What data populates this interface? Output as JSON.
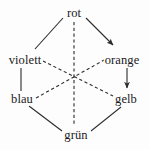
{
  "figure": {
    "type": "color-hexagon-diagram",
    "background_color": "#fdfdfd",
    "stroke_color": "#2b2b2b",
    "text_color": "#1a1a1a"
  },
  "nodes": [
    {
      "id": "rot",
      "label": "rot",
      "position": "top",
      "x": 74,
      "y": 13
    },
    {
      "id": "violett",
      "label": "violett",
      "position": "upper-left",
      "x": 25,
      "y": 60
    },
    {
      "id": "orange",
      "label": "orange",
      "position": "upper-right",
      "x": 122,
      "y": 60
    },
    {
      "id": "blau",
      "label": "blau",
      "position": "lower-left",
      "x": 22,
      "y": 99
    },
    {
      "id": "gelb",
      "label": "gelb",
      "position": "lower-right",
      "x": 126,
      "y": 99
    },
    {
      "id": "gruen",
      "label": "grün",
      "position": "bottom",
      "x": 76,
      "y": 135
    }
  ],
  "edges": [
    {
      "from": "rot",
      "to": "violett",
      "style": "solid",
      "arrow": false
    },
    {
      "from": "rot",
      "to": "orange",
      "style": "solid",
      "arrow": true
    },
    {
      "from": "violett",
      "to": "blau",
      "style": "solid",
      "arrow": false
    },
    {
      "from": "orange",
      "to": "gelb",
      "style": "solid",
      "arrow": true
    },
    {
      "from": "blau",
      "to": "gruen",
      "style": "solid",
      "arrow": false
    },
    {
      "from": "gelb",
      "to": "gruen",
      "style": "solid",
      "arrow": false
    },
    {
      "from": "rot",
      "to": "gruen",
      "style": "dashed",
      "arrow": false
    },
    {
      "from": "violett",
      "to": "gelb",
      "style": "dashed",
      "arrow": false
    },
    {
      "from": "blau",
      "to": "orange",
      "style": "dashed",
      "arrow": false
    }
  ]
}
